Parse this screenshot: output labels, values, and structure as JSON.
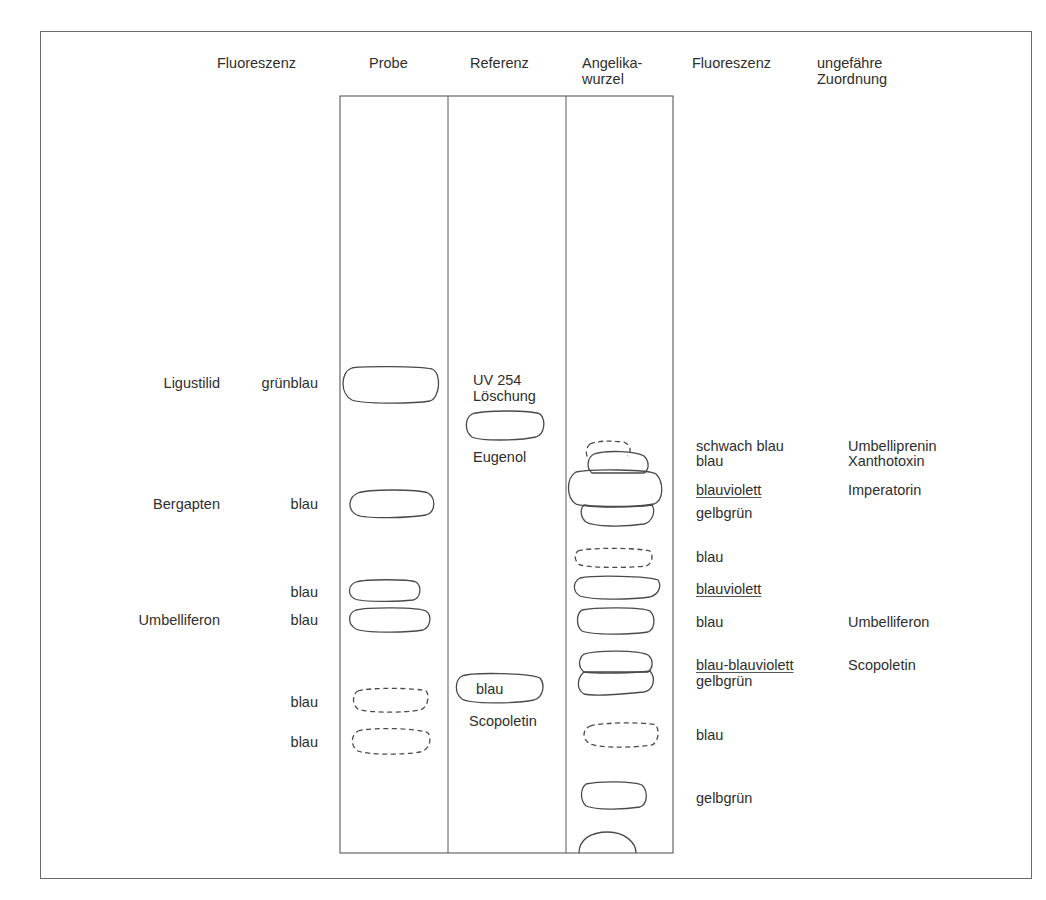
{
  "header": {
    "left_fluorescence": "Fluoreszenz",
    "probe": "Probe",
    "referenz": "Referenz",
    "angelika_line1": "Angelika-",
    "angelika_line2": "wurzel",
    "right_fluorescence": "Fluoreszenz",
    "zuordnung_line1": "ungefähre",
    "zuordnung_line2": "Zuordnung"
  },
  "probe_lane": {
    "labels": [
      {
        "compound": "Ligustilid",
        "fluorescence": "grünblau"
      },
      {
        "compound": "Bergapten",
        "fluorescence": "blau"
      },
      {
        "compound": "",
        "fluorescence": "blau"
      },
      {
        "compound": "Umbelliferon",
        "fluorescence": "blau"
      },
      {
        "compound": "",
        "fluorescence": "blau"
      },
      {
        "compound": "",
        "fluorescence": "blau"
      }
    ]
  },
  "reference_lane": {
    "uv_line1": "UV 254",
    "uv_line2": "Löschung",
    "eugenol": "Eugenol",
    "scopoletin_spot": "blau",
    "scopoletin": "Scopoletin"
  },
  "angelica_lane": {
    "fluorescence": [
      "schwach blau",
      "blau",
      "blauviolett",
      "gelbgrün",
      "blau",
      "blauviolett",
      "blau",
      "blau-blauviolett",
      "gelbgrün",
      "blau",
      "gelbgrün"
    ],
    "assignment": [
      "Umbelliprenin",
      "Xanthotoxin",
      "Imperatorin",
      "Umbelliferon",
      "Scopoletin"
    ]
  },
  "colors": {
    "line": "#4a4a4a",
    "frame": "#6a6a6a",
    "text": "#2e2e2e",
    "background": "#ffffff"
  }
}
